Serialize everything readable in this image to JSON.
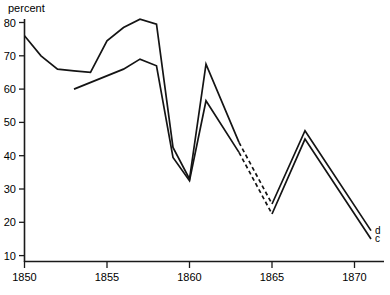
{
  "chart_data": {
    "type": "line",
    "title": "",
    "subtitle": "",
    "xlabel": "",
    "ylabel": "percent",
    "xlim": [
      1850,
      1872
    ],
    "ylim": [
      5,
      82
    ],
    "grid": false,
    "legend_position": "right-end-of-line",
    "x_ticks": [
      1850,
      1855,
      1860,
      1865,
      1870
    ],
    "x_tick_labels": [
      "1850",
      "1855",
      "1860",
      "1865",
      "1870"
    ],
    "y_ticks": [
      10,
      20,
      30,
      40,
      50,
      60,
      70,
      80
    ],
    "y_tick_labels": [
      "10",
      "20",
      "30",
      "40",
      "50",
      "60",
      "70",
      "80"
    ],
    "series": [
      {
        "name": "d",
        "label": "d",
        "style": "solid-with-dashed-gap",
        "dashed_segment_x": [
          1863,
          1865
        ],
        "x": [
          1850,
          1851,
          1852,
          1853,
          1854,
          1855,
          1856,
          1857,
          1858,
          1859,
          1860,
          1861,
          1863,
          1865,
          1867,
          1871
        ],
        "values": [
          76,
          70,
          66,
          65.5,
          65,
          74.5,
          78.5,
          81,
          79.5,
          42.5,
          33,
          67.5,
          44,
          25.5,
          47.5,
          17.5
        ]
      },
      {
        "name": "c",
        "label": "c",
        "style": "solid-with-dashed-gap",
        "dashed_segment_x": [
          1863,
          1865
        ],
        "x": [
          1853,
          1856,
          1857,
          1858,
          1859,
          1860,
          1861,
          1863,
          1865,
          1867,
          1871
        ],
        "values": [
          60,
          66,
          69,
          67,
          39.5,
          32.5,
          56.5,
          41,
          22.5,
          45,
          15
        ]
      }
    ]
  },
  "axis": {
    "y_axis_title": "percent"
  },
  "series_labels": {
    "upper": "d",
    "lower": "c"
  }
}
